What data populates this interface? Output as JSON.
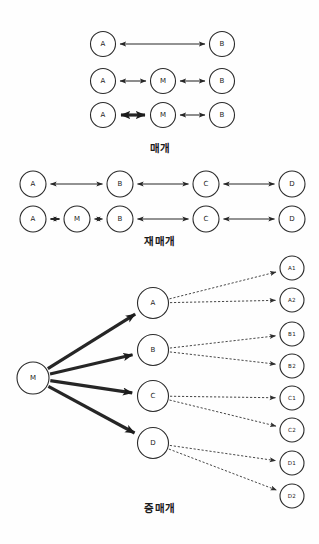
{
  "page": {
    "background_color": "#fdfdfd",
    "ink_color": "#262626",
    "node_fill": "#ffffff"
  },
  "sections": [
    {
      "id": "section-mediation",
      "caption": "매개",
      "caption_x": 160,
      "caption_y": 152,
      "rows": [
        {
          "id": "row-1",
          "nodes": [
            {
              "label": "A",
              "cx": 103,
              "cy": 44,
              "r": 12.5
            },
            {
              "label": "B",
              "cx": 222,
              "cy": 44,
              "r": 12.5
            }
          ],
          "edges": [
            {
              "from": "A",
              "to": "B",
              "style": "normal",
              "arrows": "both"
            }
          ]
        },
        {
          "id": "row-2",
          "nodes": [
            {
              "label": "A",
              "cx": 103,
              "cy": 81,
              "r": 12.5
            },
            {
              "label": "M",
              "cx": 163,
              "cy": 81,
              "r": 12.5
            },
            {
              "label": "B",
              "cx": 222,
              "cy": 81,
              "r": 12.5
            }
          ],
          "edges": [
            {
              "from": "A",
              "to": "M",
              "style": "normal",
              "arrows": "both"
            },
            {
              "from": "M",
              "to": "B",
              "style": "normal",
              "arrows": "both"
            }
          ]
        },
        {
          "id": "row-3",
          "nodes": [
            {
              "label": "A",
              "cx": 103,
              "cy": 115,
              "r": 12.5
            },
            {
              "label": "M",
              "cx": 163,
              "cy": 115,
              "r": 12.5
            },
            {
              "label": "B",
              "cx": 222,
              "cy": 115,
              "r": 12.5
            }
          ],
          "edges": [
            {
              "from": "A",
              "to": "M",
              "style": "bold",
              "arrows": "both"
            },
            {
              "from": "M",
              "to": "B",
              "style": "normal",
              "arrows": "both"
            }
          ]
        }
      ]
    },
    {
      "id": "section-remediation",
      "caption": "재매개",
      "caption_x": 160,
      "caption_y": 245,
      "rows": [
        {
          "id": "row-1",
          "nodes": [
            {
              "label": "A",
              "cx": 33,
              "cy": 184,
              "r": 13
            },
            {
              "label": "B",
              "cx": 120,
              "cy": 184,
              "r": 13
            },
            {
              "label": "C",
              "cx": 206,
              "cy": 184,
              "r": 13
            },
            {
              "label": "D",
              "cx": 292,
              "cy": 184,
              "r": 13
            }
          ],
          "edges": [
            {
              "from": "A",
              "to": "B",
              "style": "normal",
              "arrows": "both"
            },
            {
              "from": "B",
              "to": "C",
              "style": "normal",
              "arrows": "both"
            },
            {
              "from": "C",
              "to": "D",
              "style": "normal",
              "arrows": "both"
            }
          ]
        },
        {
          "id": "row-2",
          "nodes": [
            {
              "label": "A",
              "cx": 33,
              "cy": 219,
              "r": 13
            },
            {
              "label": "M",
              "cx": 77,
              "cy": 219,
              "r": 13
            },
            {
              "label": "B",
              "cx": 120,
              "cy": 219,
              "r": 13
            },
            {
              "label": "C",
              "cx": 206,
              "cy": 219,
              "r": 13
            },
            {
              "label": "D",
              "cx": 292,
              "cy": 219,
              "r": 13
            }
          ],
          "edges": [
            {
              "from": "A",
              "to": "M",
              "style": "thickish",
              "arrows": "both"
            },
            {
              "from": "M",
              "to": "B",
              "style": "normal",
              "arrows": "both"
            },
            {
              "from": "B",
              "to": "C",
              "style": "normal",
              "arrows": "both"
            },
            {
              "from": "C",
              "to": "D",
              "style": "normal",
              "arrows": "both"
            }
          ]
        }
      ]
    },
    {
      "id": "section-hub-mediation",
      "caption": "중매개",
      "caption_x": 160,
      "caption_y": 512,
      "hub": {
        "label": "M",
        "cx": 33,
        "cy": 378,
        "r": 16
      },
      "mid_nodes": [
        {
          "label": "A",
          "cx": 153,
          "cy": 303,
          "r": 15.5
        },
        {
          "label": "B",
          "cx": 153,
          "cy": 350,
          "r": 15.5
        },
        {
          "label": "C",
          "cx": 153,
          "cy": 396,
          "r": 15.5
        },
        {
          "label": "D",
          "cx": 153,
          "cy": 443,
          "r": 15.5
        }
      ],
      "leaf_nodes": [
        {
          "label": "A1",
          "cx": 292,
          "cy": 268,
          "r": 12,
          "parent": "A"
        },
        {
          "label": "A2",
          "cx": 292,
          "cy": 300,
          "r": 12,
          "parent": "A"
        },
        {
          "label": "B1",
          "cx": 292,
          "cy": 334,
          "r": 12,
          "parent": "B"
        },
        {
          "label": "B2",
          "cx": 292,
          "cy": 366,
          "r": 12,
          "parent": "B"
        },
        {
          "label": "C1",
          "cx": 292,
          "cy": 398,
          "r": 12,
          "parent": "C"
        },
        {
          "label": "C2",
          "cx": 292,
          "cy": 430,
          "r": 12,
          "parent": "C"
        },
        {
          "label": "D1",
          "cx": 292,
          "cy": 463,
          "r": 12,
          "parent": "D"
        },
        {
          "label": "D2",
          "cx": 292,
          "cy": 496,
          "r": 12,
          "parent": "D"
        }
      ],
      "hub_edge_style": "bold",
      "leaf_edge_style": "dashed"
    }
  ]
}
